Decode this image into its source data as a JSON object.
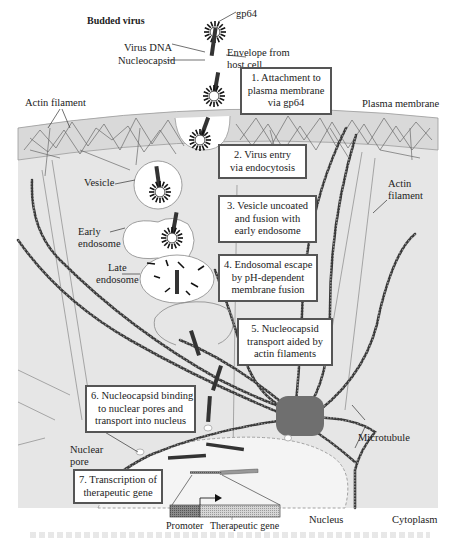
{
  "figure": {
    "colors": {
      "cytoplasm": "#e6e6e6",
      "membrane_band": "#d9d9d9",
      "nucleus": "#f4f4f4",
      "vesicle": "#ffffff",
      "mtoc": "#6f6f6f",
      "microtubule": "#3a3a3a",
      "box_border": "#555555",
      "promoter": "#7a7a7a",
      "therapeutic_gene": "#cfcfcf"
    }
  },
  "labels": {
    "budded_virus": "Budded virus",
    "gp64": "gp64",
    "virus_dna": "Virus DNA",
    "nucleocapsid": "Nucleocapsid",
    "envelope_line1": "Envelope from",
    "envelope_line2": "host cell",
    "actin_filament_top": "Actin filament",
    "plasma_membrane": "Plasma membrane",
    "actin_filament_right_1": "Actin",
    "actin_filament_right_2": "filament",
    "vesicle": "Vesicle",
    "early_endosome_1": "Early",
    "early_endosome_2": "endosome",
    "late_endosome_1": "Late",
    "late_endosome_2": "endosome",
    "nuclear_pore_1": "Nuclear",
    "nuclear_pore_2": "pore",
    "microtubule": "Microtubule",
    "nucleus": "Nucleus",
    "cytoplasm": "Cytoplasm",
    "promoter": "Promoter",
    "therapeutic_gene": "Therapeutic gene"
  },
  "steps": [
    {
      "lines": [
        "1. Attachment to",
        "plasma membrane",
        "via gp64"
      ]
    },
    {
      "lines": [
        "2. Virus entry",
        "via endocytosis"
      ]
    },
    {
      "lines": [
        "3. Vesicle uncoated",
        "and fusion with",
        "early endosome"
      ]
    },
    {
      "lines": [
        "4. Endosomal escape",
        "by pH-dependent",
        "membrane fusion"
      ]
    },
    {
      "lines": [
        "5. Nucleocapsid",
        "transport aided by",
        "actin filaments"
      ]
    },
    {
      "lines": [
        "6. Nucleocapsid binding",
        "to nuclear pores and",
        "transport into nucleus"
      ]
    },
    {
      "lines": [
        "7. Transcription of",
        "therapeutic gene"
      ]
    }
  ]
}
